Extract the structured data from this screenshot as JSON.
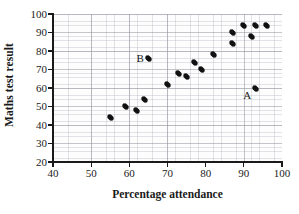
{
  "chart_data": {
    "type": "scatter",
    "title": "",
    "xlabel": "Percentage attendance",
    "ylabel": "Maths test result",
    "xlim": [
      40,
      100
    ],
    "ylim": [
      20,
      100
    ],
    "xticks": [
      40,
      50,
      60,
      70,
      80,
      90,
      100
    ],
    "yticks": [
      20,
      30,
      40,
      50,
      60,
      70,
      80,
      90,
      100
    ],
    "grid": true,
    "grid_minor_step_x": 2,
    "grid_minor_step_y": 2,
    "legend": "none",
    "marker_color": "#111111",
    "points": [
      {
        "x": 55,
        "y": 44,
        "label": ""
      },
      {
        "x": 59,
        "y": 50,
        "label": ""
      },
      {
        "x": 62,
        "y": 48,
        "label": ""
      },
      {
        "x": 64,
        "y": 54,
        "label": ""
      },
      {
        "x": 65,
        "y": 76,
        "label": "B"
      },
      {
        "x": 70,
        "y": 62,
        "label": ""
      },
      {
        "x": 73,
        "y": 68,
        "label": ""
      },
      {
        "x": 75,
        "y": 66,
        "label": ""
      },
      {
        "x": 77,
        "y": 74,
        "label": ""
      },
      {
        "x": 79,
        "y": 70,
        "label": ""
      },
      {
        "x": 82,
        "y": 78,
        "label": ""
      },
      {
        "x": 87,
        "y": 84,
        "label": ""
      },
      {
        "x": 87,
        "y": 90,
        "label": ""
      },
      {
        "x": 90,
        "y": 94,
        "label": ""
      },
      {
        "x": 92,
        "y": 88,
        "label": ""
      },
      {
        "x": 93,
        "y": 60,
        "label": "A"
      },
      {
        "x": 93,
        "y": 94,
        "label": ""
      },
      {
        "x": 96,
        "y": 94,
        "label": ""
      }
    ],
    "annotations": [
      {
        "text": "A",
        "x": 93,
        "y": 60,
        "position": "left"
      },
      {
        "text": "B",
        "x": 65,
        "y": 76,
        "position": "left"
      }
    ]
  }
}
